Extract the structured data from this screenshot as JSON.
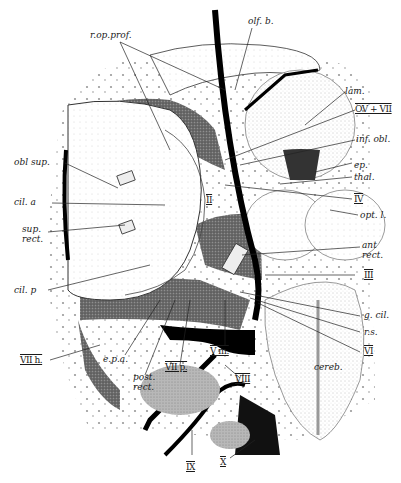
{
  "figure": {
    "labels": {
      "r_op_prof": "r.op.prof.",
      "olf_b": "olf. b.",
      "lam": "lam.",
      "ov_vii": "OV + VII",
      "inf_obl": "inf. obl.",
      "obl_sup": "obl sup.",
      "ep": "ep.",
      "thal": "thal.",
      "iv": "IV",
      "cil_a": "cil. a",
      "ii": "II",
      "opt_l": "opt. l.",
      "sup_rect": "sup.\nrect.",
      "ant_rect": "ant\nrect.",
      "iii": "III",
      "cil_p": "cil. p",
      "g_cil": "g. cil.",
      "r_s": "r.s.",
      "vi": "VI",
      "vii_h": "VII h.",
      "e_p_a": "e.p.a.",
      "post_rect": "post.\nrect.",
      "vii_p": "VII p.",
      "v_m": "V m.",
      "viii": "VIII",
      "cereb": "cereb.",
      "ix": "IX",
      "x": "X"
    }
  }
}
